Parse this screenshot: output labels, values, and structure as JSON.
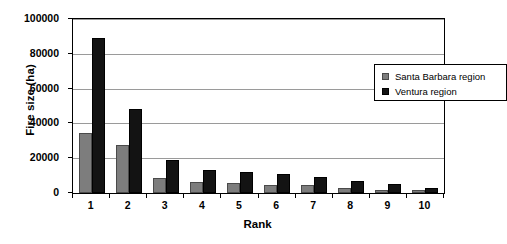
{
  "chart_data": {
    "type": "bar",
    "title": "",
    "xlabel": "Rank",
    "ylabel": "Fire size (ha)",
    "categories": [
      "1",
      "2",
      "3",
      "4",
      "5",
      "6",
      "7",
      "8",
      "9",
      "10"
    ],
    "series": [
      {
        "name": "Santa Barbara region",
        "color": "#7d7d7d",
        "values": [
          34500,
          27500,
          8500,
          6500,
          5500,
          4500,
          4500,
          3000,
          2000,
          1500
        ]
      },
      {
        "name": "Ventura region",
        "color": "#131313",
        "values": [
          89000,
          48500,
          19000,
          13500,
          12000,
          11000,
          9000,
          7000,
          5000,
          3000
        ]
      }
    ],
    "ylim": [
      0,
      100000
    ],
    "yticks": [
      0,
      20000,
      40000,
      60000,
      80000,
      100000
    ],
    "ytick_labels": [
      "0",
      "20000",
      "40000",
      "60000",
      "80000",
      "100000"
    ],
    "grid": true,
    "grid_axis": "y",
    "legend_position": "upper right",
    "legend_entries": [
      "Santa Barbara region",
      "Ventura region"
    ]
  },
  "axes": {
    "y_title": "Fire size (ha)",
    "x_title": "Rank"
  }
}
